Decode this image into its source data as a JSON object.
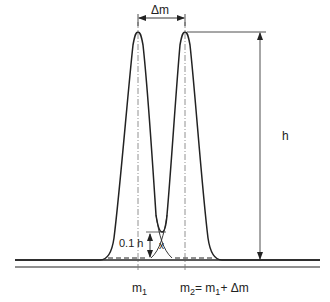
{
  "diagram": {
    "labels": {
      "delta_m": "Δm",
      "height": "h",
      "valley": "0.1 h",
      "valley_mark": "x",
      "m1_base": "m",
      "m1_sub": "1",
      "m2_base": "m",
      "m2_sub": "2",
      "m2_eq": "= m",
      "m2_eq_sub": "1",
      "m2_plus": "+  Δm"
    },
    "colors": {
      "line": "#222222",
      "dashdot": "#777777",
      "background": "#ffffff"
    },
    "peaks": [
      {
        "name": "peak-1",
        "center_x": 138,
        "apex_y": 32
      },
      {
        "name": "peak-2",
        "center_x": 185,
        "apex_y": 32
      }
    ],
    "baseline_y": 260,
    "valley_y": 232
  }
}
